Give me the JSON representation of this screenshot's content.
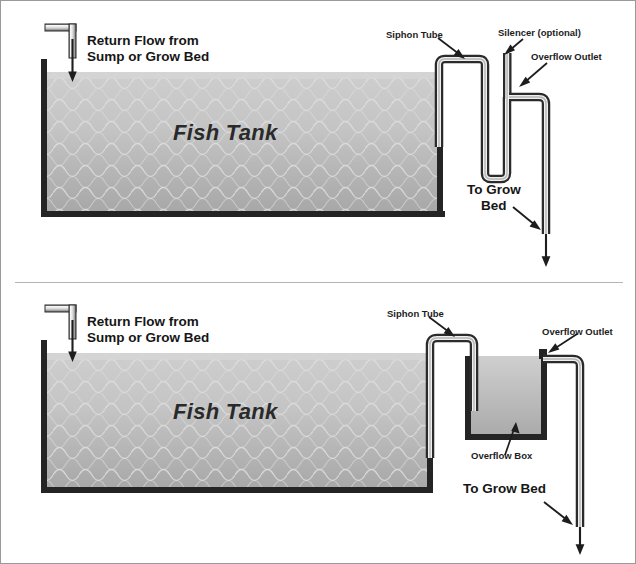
{
  "figure": {
    "background_color": "#ffffff",
    "frame_border_color": "#9a9a9a",
    "water_color_top": "#c9c9c9",
    "water_color_bottom": "#a9a9a9",
    "tank_wall_color": "#262626",
    "pipe_outline_color": "#2b2b2b",
    "pipe_fill_color": "#f2f2f2",
    "text_color": "#1d1d1d"
  },
  "panels": [
    {
      "id": "top",
      "name": "Silencer standpipe configuration",
      "labels": {
        "return_flow": "Return Flow from\nSump or Grow Bed",
        "tank": "Fish Tank",
        "siphon_tube": "Siphon Tube",
        "silencer": "Silencer (optional)",
        "overflow_outlet": "Overflow Outlet",
        "to_grow_bed": "To Grow\nBed"
      }
    },
    {
      "id": "bottom",
      "name": "Overflow box configuration",
      "labels": {
        "return_flow": "Return Flow from\nSump or Grow Bed",
        "tank": "Fish Tank",
        "siphon_tube": "Siphon Tube",
        "overflow_outlet": "Overflow Outlet",
        "overflow_box": "Overflow Box",
        "to_grow_bed": "To Grow Bed"
      }
    }
  ]
}
